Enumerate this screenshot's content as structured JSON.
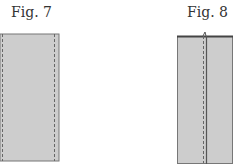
{
  "figures": [
    {
      "label": "Fig. 7",
      "description": "rectangle with two dashed stitch lines near left and right edges"
    },
    {
      "label": "Fig. 8",
      "description": "rectangle with a folded top edge, a central dashed stitch line and a solid seam line"
    }
  ],
  "colors": {
    "fill": "#cdcdcd",
    "stroke": "#555555",
    "stitch": "#666666"
  }
}
